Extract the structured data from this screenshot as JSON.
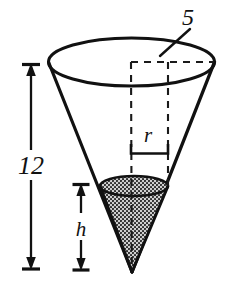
{
  "figure": {
    "kind": "geometry-diagram",
    "background_color": "#ffffff",
    "stroke_color": "#111111",
    "shade_fill_color": "#c9c9c9",
    "shade_dot_color": "#2b2b2b",
    "labels": {
      "top_radius": "5",
      "total_height": "12",
      "inner_radius": "r",
      "inner_height": "h"
    },
    "annotations": {
      "height_dimension_name": "12",
      "radius_dimension_name": "5",
      "inner_height_dimension_name": "h",
      "inner_radius_dimension_name": "r"
    },
    "geometry": {
      "top_ellipse_center_x": 131,
      "top_ellipse_center_y": 62,
      "top_ellipse_rx": 83,
      "top_ellipse_ry": 24,
      "apex_x": 132,
      "apex_y": 272,
      "inner_ellipse_center_x": 134,
      "inner_ellipse_center_y": 186,
      "inner_ellipse_rx": 34,
      "inner_ellipse_ry": 10,
      "height_dim_x": 31,
      "height_dim_top_y": 65,
      "height_dim_bottom_y": 269,
      "inner_height_dim_x": 81,
      "inner_height_dim_top_y": 184,
      "inner_height_dim_bottom_y": 270,
      "radius_bracket_left_x": 131,
      "radius_bracket_right_x": 168,
      "radius_bracket_y": 152
    }
  }
}
